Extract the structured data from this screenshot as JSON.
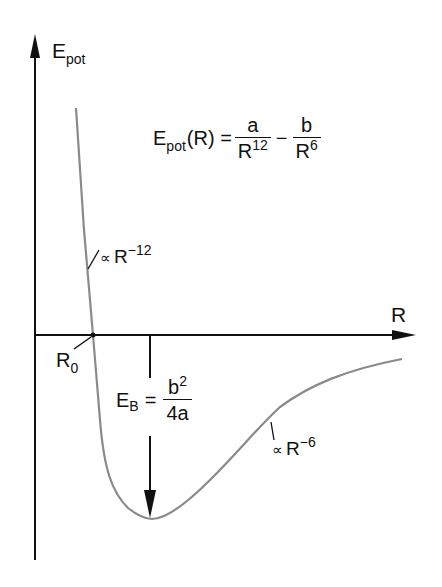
{
  "diagram": {
    "axes": {
      "y_label": {
        "main": "E",
        "sub": "pot"
      },
      "x_label": "R"
    },
    "formula": {
      "lhs_main": "E",
      "lhs_sub": "pot",
      "lhs_arg": "(R) =",
      "term1_num": "a",
      "term1_den_base": "R",
      "term1_den_exp": "12",
      "operator": "−",
      "term2_num": "b",
      "term2_den_base": "R",
      "term2_den_exp": "6"
    },
    "annotations": {
      "repulsive": {
        "symbol": "∝",
        "base": "R",
        "exp": "−12"
      },
      "attractive": {
        "symbol": "∝",
        "base": "R",
        "exp": "−6"
      },
      "r0": {
        "main": "R",
        "sub": "0"
      },
      "binding_energy": {
        "lhs_main": "E",
        "lhs_sub": "B",
        "eq": "=",
        "num_base": "b",
        "num_exp": "2",
        "den": "4a"
      }
    },
    "colors": {
      "axis": "#111111",
      "curve": "#8a8a8a",
      "background": "#ffffff"
    }
  }
}
